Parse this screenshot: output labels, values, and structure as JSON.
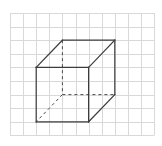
{
  "diagram": {
    "type": "cube-on-grid",
    "grid": {
      "columns": 11,
      "rows": 9,
      "origin_px": [
        10,
        13
      ],
      "cell_width_px": 13.1,
      "cell_height_px": 13.6,
      "line_color": "#d9d9d9"
    },
    "cube": {
      "edge_color": "#3c3c3c",
      "vertices_grid": {
        "front_top_left": [
          2,
          4
        ],
        "front_top_right": [
          6,
          4
        ],
        "front_bottom_left": [
          2,
          8
        ],
        "front_bottom_right": [
          6,
          8
        ],
        "back_top_left": [
          4,
          2
        ],
        "back_top_right": [
          8,
          2
        ],
        "back_bottom_left": [
          4,
          6
        ],
        "back_bottom_right": [
          8,
          6
        ]
      },
      "visible_edges": [
        [
          "front_top_left",
          "front_top_right"
        ],
        [
          "front_top_right",
          "front_bottom_right"
        ],
        [
          "front_bottom_right",
          "front_bottom_left"
        ],
        [
          "front_bottom_left",
          "front_top_left"
        ],
        [
          "front_top_left",
          "back_top_left"
        ],
        [
          "back_top_left",
          "back_top_right"
        ],
        [
          "back_top_right",
          "front_top_right"
        ],
        [
          "back_top_right",
          "back_bottom_right"
        ],
        [
          "back_bottom_right",
          "front_bottom_right"
        ]
      ],
      "hidden_edges": [
        [
          "back_top_left",
          "back_bottom_left"
        ],
        [
          "back_bottom_left",
          "back_bottom_right"
        ],
        [
          "back_bottom_left",
          "front_bottom_left"
        ]
      ]
    }
  }
}
